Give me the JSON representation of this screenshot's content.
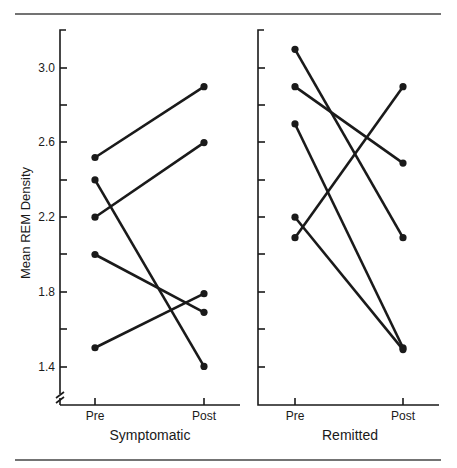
{
  "chart_data": [
    {
      "type": "line",
      "title": "Symptomatic",
      "xlabel": "Symptomatic",
      "ylabel": "Mean REM Density",
      "categories": [
        "Pre",
        "Post"
      ],
      "ylim": [
        1.2,
        3.2
      ],
      "yticks": [
        1.4,
        1.8,
        2.2,
        2.6,
        3.0
      ],
      "minor_yticks": [
        1.6,
        2.0,
        2.4,
        2.8
      ],
      "axis_break": true,
      "grid": false,
      "series": [
        {
          "name": "Subject 1",
          "values": [
            2.52,
            2.9
          ]
        },
        {
          "name": "Subject 2",
          "values": [
            2.2,
            2.6
          ]
        },
        {
          "name": "Subject 3",
          "values": [
            2.4,
            1.4
          ]
        },
        {
          "name": "Subject 4",
          "values": [
            2.0,
            1.69
          ]
        },
        {
          "name": "Subject 5",
          "values": [
            1.5,
            1.79
          ]
        }
      ]
    },
    {
      "type": "line",
      "title": "Remitted",
      "xlabel": "Remitted",
      "ylabel": "Mean REM Density",
      "categories": [
        "Pre",
        "Post"
      ],
      "ylim": [
        1.2,
        3.2
      ],
      "grid": false,
      "series": [
        {
          "name": "Subject 1",
          "values": [
            3.1,
            2.09
          ]
        },
        {
          "name": "Subject 2",
          "values": [
            2.9,
            2.49
          ]
        },
        {
          "name": "Subject 3",
          "values": [
            2.7,
            1.5
          ]
        },
        {
          "name": "Subject 4",
          "values": [
            2.2,
            1.49
          ]
        },
        {
          "name": "Subject 5",
          "values": [
            2.09,
            2.9
          ]
        }
      ]
    }
  ],
  "labels": {
    "ylabel": "Mean REM Density",
    "yticks": [
      "3.0",
      "2.6",
      "2.2",
      "1.8",
      "1.4"
    ],
    "left_panel": {
      "title": "Symptomatic",
      "pre": "Pre",
      "post": "Post"
    },
    "right_panel": {
      "title": "Remitted",
      "pre": "Pre",
      "post": "Post"
    }
  },
  "colors": {
    "ink": "#1a1a1a",
    "rule": "#444444",
    "background": "#ffffff"
  }
}
